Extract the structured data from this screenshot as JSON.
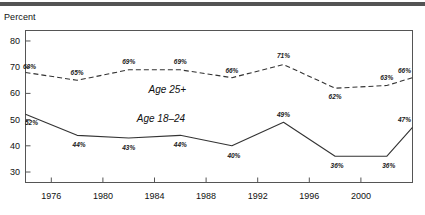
{
  "figure": {
    "axis_title": "Percent",
    "top_rule_color": "#545454",
    "background": "#ffffff",
    "frame_color": "#555555"
  },
  "chart_data": {
    "type": "line",
    "title": "",
    "subtitle": "",
    "xlabel": "",
    "ylabel": "Percent",
    "grid": false,
    "legend_position": "inline-annotation",
    "x": [
      1974,
      1976,
      1978,
      1980,
      1982,
      1984,
      1986,
      1988,
      1990,
      1992,
      1994,
      1996,
      1998,
      2000,
      2002,
      2004
    ],
    "xlim": [
      1974,
      2004
    ],
    "ylim": [
      26,
      84
    ],
    "xticks": [
      1976,
      1980,
      1984,
      1988,
      1992,
      1996,
      2000
    ],
    "xtick_labels": [
      "1976",
      "1980",
      "1984",
      "1988",
      "1992",
      "1996",
      "2000"
    ],
    "yticks": [
      30,
      40,
      50,
      60,
      70,
      80
    ],
    "ytick_labels": [
      "30",
      "40",
      "50",
      "60",
      "70",
      "80"
    ],
    "series": [
      {
        "name": "Age 25+",
        "label": "Age 25+",
        "style": "dashed",
        "color": "#333333",
        "x": [
          1974,
          1978,
          1982,
          1986,
          1990,
          1994,
          1998,
          2002,
          2004
        ],
        "values": [
          68,
          65,
          69,
          69,
          66,
          71,
          62,
          63,
          66
        ],
        "point_labels": [
          "68%",
          "65%",
          "69%",
          "69%",
          "66%",
          "71%",
          "62%",
          "63%",
          "66%"
        ],
        "annotation_x": 1985,
        "annotation_y": 61.5
      },
      {
        "name": "Age 18-24",
        "label": "Age 18–24",
        "style": "solid",
        "color": "#333333",
        "x": [
          1974,
          1978,
          1982,
          1986,
          1990,
          1994,
          1998,
          2002,
          2004
        ],
        "values": [
          52,
          44,
          43,
          44,
          40,
          49,
          36,
          36,
          47
        ],
        "point_labels": [
          "52%",
          "44%",
          "43%",
          "44%",
          "40%",
          "49%",
          "36%",
          "36%",
          "47%"
        ],
        "annotation_x": 1984.5,
        "annotation_y": 50.5
      }
    ]
  }
}
